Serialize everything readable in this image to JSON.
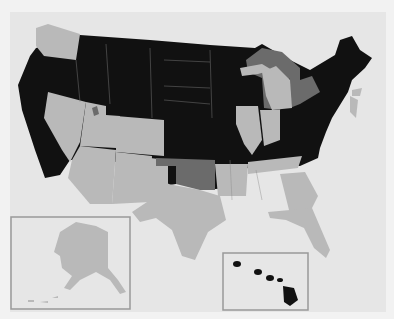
{
  "map": {
    "type": "choropleth",
    "region": "United States",
    "colors": {
      "background": "#e6e6e6",
      "category_dark": "#111111",
      "category_light": "#b9b9b9",
      "category_medium": "#6b6b6b"
    },
    "states_by_shade": {
      "dark": [
        "OR",
        "CA",
        "ID",
        "MT",
        "WY",
        "ND",
        "SD",
        "NE",
        "KS",
        "CO",
        "MN",
        "WI",
        "IA",
        "MO",
        "LA",
        "MS",
        "AL",
        "KY",
        "OH",
        "WV",
        "VA",
        "NC",
        "SC",
        "PA",
        "NY",
        "VT",
        "NH",
        "ME",
        "MA",
        "CT",
        "RI",
        "MD",
        "DE",
        "HI"
      ],
      "light": [
        "WA",
        "NV",
        "UT",
        "AZ",
        "NM",
        "TX",
        "AR",
        "TN",
        "GA",
        "FL",
        "IL",
        "IN",
        "MI",
        "NJ",
        "AK"
      ],
      "medium": [
        "OK",
        "Great Lakes",
        "Great Salt Lake"
      ]
    },
    "insets": [
      "Alaska",
      "Hawaii"
    ]
  }
}
